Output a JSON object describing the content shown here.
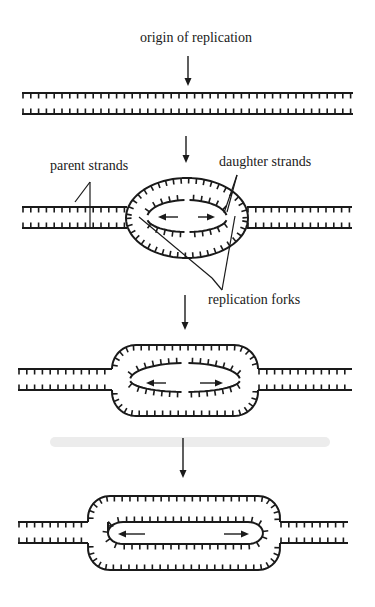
{
  "diagram": {
    "labels": {
      "origin": "origin of replication",
      "parent_strands": "parent strands",
      "daughter_strands": "daughter strands",
      "replication_forks": "replication forks"
    },
    "stages": [
      {
        "name": "unreplicated DNA"
      },
      {
        "name": "small replication bubble"
      },
      {
        "name": "larger replication bubble"
      },
      {
        "name": "largest replication bubble"
      }
    ],
    "colors": {
      "ink": "#1a1a1a",
      "background": "#ffffff"
    }
  }
}
